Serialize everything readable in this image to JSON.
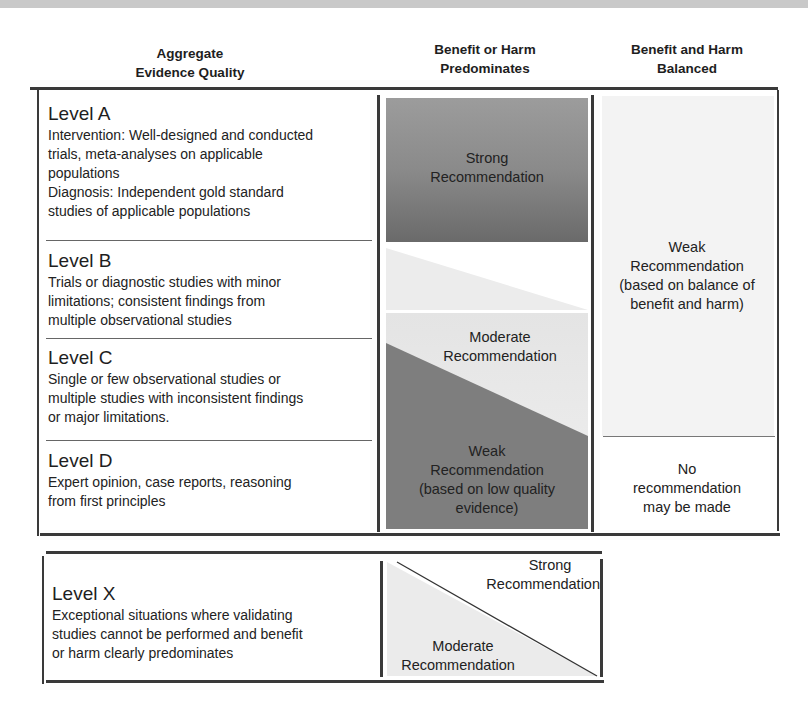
{
  "headers": {
    "col1": [
      "Aggregate",
      "Evidence Quality"
    ],
    "col2": [
      "Benefit or Harm",
      "Predominates"
    ],
    "col3": [
      "Benefit and Harm",
      "Balanced"
    ]
  },
  "levels": [
    {
      "title": "Level A",
      "desc": [
        "Intervention: Well-designed and conducted",
        "trials, meta-analyses on applicable",
        "populations",
        "Diagnosis: Independent gold standard",
        "studies of applicable populations"
      ]
    },
    {
      "title": "Level B",
      "desc": [
        "Trials or diagnostic studies with minor",
        "limitations; consistent findings from",
        "multiple observational studies"
      ]
    },
    {
      "title": "Level C",
      "desc": [
        "Single or few observational studies or",
        "multiple studies with inconsistent findings",
        "or major limitations."
      ]
    },
    {
      "title": "Level D",
      "desc": [
        "Expert opinion, case reports, reasoning",
        "from first principles"
      ]
    }
  ],
  "level_x": {
    "title": "Level X",
    "desc": [
      "Exceptional situations where validating",
      "studies cannot be performed and benefit",
      "or harm clearly predominates"
    ]
  },
  "recommendations": {
    "strong": [
      "Strong",
      "Recommendation"
    ],
    "moderate": [
      "Moderate",
      "Recommendation"
    ],
    "weak_low_quality": [
      "Weak",
      "Recommendation",
      "(based on low quality",
      "evidence)"
    ],
    "weak_balance": [
      "Weak",
      "Recommendation",
      "(based on balance of",
      "benefit and harm)"
    ],
    "none": [
      "No",
      "recommendation",
      "may be made"
    ],
    "x_strong": [
      "Strong",
      "Recommendation"
    ],
    "x_moderate": [
      "Moderate",
      "Recommendation"
    ]
  },
  "colors": {
    "strong_dark": "#6f6f6f",
    "strong_light": "#9a9a9a",
    "moderate_light": "#e6e6e6",
    "weak_dark": "#7d7d7d",
    "balanced_panel": "#f3f3f3",
    "rule": "#3a3a3a"
  }
}
